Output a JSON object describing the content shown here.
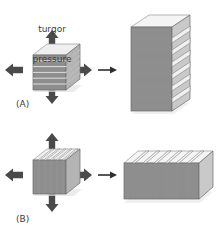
{
  "figure": {
    "width": 223,
    "height": 238,
    "background": "#ffffff",
    "annotation_color": "#3a3a3a"
  },
  "labels": {
    "turgor_line1": "turgor",
    "turgor_line2": "pressure",
    "panel_a": "(A)",
    "panel_b": "(B)"
  },
  "colors": {
    "front_face": "#8e8e8e",
    "front_face_dark": "#7f7f7f",
    "side_face": "#b4b4b4",
    "top_face": "#efefef",
    "top_face_shade": "#dcdcdc",
    "outline": "#6a6a6a",
    "outline_light": "#9a9a9a",
    "arrow_block": "#4a4a4a",
    "arrow_thin": "#2e2e2e",
    "shadow": "#d9d9d9"
  },
  "panels": [
    {
      "id": "a",
      "label": "(A)",
      "lamella_orientation": "horizontal",
      "source_shape": "cube",
      "source_layers": 6,
      "result_shape": "tall-prism",
      "result_layers": 7,
      "pressure_arrows": [
        "up",
        "down",
        "left",
        "right"
      ],
      "transition_arrow": "right"
    },
    {
      "id": "b",
      "label": "(B)",
      "lamella_orientation": "vertical",
      "source_shape": "cube",
      "source_layers": 6,
      "result_shape": "wide-slab",
      "result_layers": 7,
      "pressure_arrows": [
        "up",
        "down",
        "left",
        "right"
      ],
      "transition_arrow": "right"
    }
  ],
  "arrows": {
    "turgor_up": "arrow-up",
    "turgor_down": "arrow-down",
    "turgor_left": "arrow-left",
    "turgor_right": "arrow-right",
    "transform": "arrow-right-thin"
  }
}
